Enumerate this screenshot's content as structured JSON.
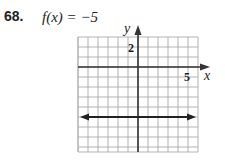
{
  "problem": {
    "number": "68.",
    "equation": "f(x) = −5"
  },
  "chart_data": {
    "type": "line",
    "title": "f(x) = −5",
    "xlabel": "x",
    "ylabel": "y",
    "xlim": [
      -6,
      6
    ],
    "ylim": [
      -8.5,
      3
    ],
    "grid": true,
    "tick_labels": {
      "x": [
        "5"
      ],
      "y": [
        "2"
      ]
    },
    "series": [
      {
        "name": "f(x) = −5",
        "x": [
          -6,
          6
        ],
        "values": [
          -5,
          -5
        ],
        "arrows": "both"
      }
    ]
  },
  "labels": {
    "x_axis": "x",
    "y_axis": "y",
    "x_tick": "5",
    "y_tick": "2"
  }
}
